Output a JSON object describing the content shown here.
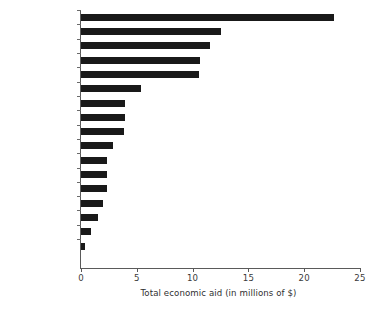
{
  "chart_data": {
    "type": "bar",
    "orientation": "horizontal",
    "title": "",
    "xlabel": "Total economic aid (in millions of $)",
    "ylabel": "",
    "xlim": [
      0,
      25
    ],
    "xticks": [
      0,
      5,
      10,
      15,
      20,
      25
    ],
    "xtick_labels": [
      "0",
      "5",
      "10",
      "15",
      "20",
      "25"
    ],
    "grid": false,
    "legend": false,
    "bar_color": "#191919",
    "axis_color": "#5a5a5a",
    "categories": [
      "USA",
      "United Kingdom",
      "Japan",
      "France",
      "Germany",
      "Netherlands",
      "Sweden",
      "Canada",
      "Italy",
      "Norway",
      "Denmark",
      "Australia",
      "Belgium",
      "Switzerland",
      "Austria",
      "Finland",
      "New Zealand"
    ],
    "values": [
      22.7,
      12.5,
      11.6,
      10.7,
      10.6,
      5.4,
      3.9,
      3.9,
      3.85,
      2.9,
      2.3,
      2.3,
      2.3,
      2.0,
      1.5,
      0.9,
      0.4
    ]
  }
}
